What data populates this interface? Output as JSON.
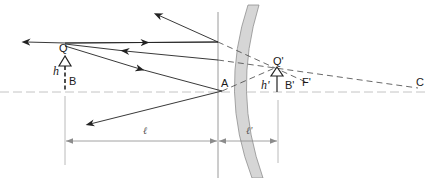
{
  "diagram": {
    "type": "convex-mirror-ray-diagram",
    "colors": {
      "ray": "#222222",
      "axis": "#bfbfbf",
      "mirror_fill": "#d4d4d4",
      "mirror_edge": "#8a8a8a",
      "dimension": "#8c8c8c"
    },
    "labels": {
      "object_top": "Q",
      "object_base": "B",
      "object_height": "h",
      "vertex": "A",
      "image_top": "Q'",
      "image_base": "B'",
      "image_height": "h'",
      "focal_point": "F'",
      "center_of_curvature": "C",
      "object_distance": "ℓ",
      "image_distance": "ℓ'"
    }
  }
}
